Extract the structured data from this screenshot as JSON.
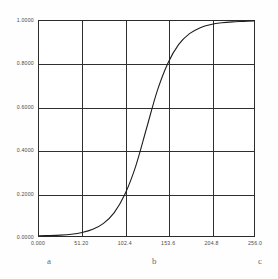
{
  "chart_data": {
    "type": "line",
    "title": "",
    "subtitle": "",
    "xlabel": "",
    "ylabel": "",
    "xlim": [
      0.0,
      256.0
    ],
    "ylim": [
      0.0,
      1.0
    ],
    "grid": true,
    "legend": null,
    "x_ticks": [
      "0.000",
      "51.20",
      "102.4",
      "153.6",
      "204.8",
      "256.0"
    ],
    "x_tick_values": [
      0.0,
      51.2,
      102.4,
      153.6,
      204.8,
      256.0
    ],
    "y_ticks": [
      "0.0000",
      "0.2000",
      "0.4000",
      "0.6000",
      "0.8000",
      "1.0000"
    ],
    "y_tick_values": [
      0.0,
      0.2,
      0.4,
      0.6,
      0.8,
      1.0
    ],
    "series": [
      {
        "name": "sigmoid",
        "color": "#1d1d1d",
        "x": [
          0.0,
          12.8,
          25.6,
          38.4,
          51.2,
          64.0,
          76.8,
          89.6,
          102.4,
          115.2,
          128.0,
          140.8,
          153.6,
          166.4,
          179.2,
          192.0,
          204.8,
          217.6,
          230.4,
          243.2,
          256.0
        ],
        "values": [
          0.001,
          0.002,
          0.004,
          0.008,
          0.016,
          0.031,
          0.059,
          0.109,
          0.195,
          0.325,
          0.5,
          0.675,
          0.805,
          0.891,
          0.941,
          0.969,
          0.984,
          0.992,
          0.996,
          0.998,
          1.0
        ]
      }
    ],
    "annotations": [
      {
        "label": "a",
        "x_value": 13.0
      },
      {
        "label": "b",
        "x_value": 137.0
      },
      {
        "label": "c",
        "x_value": 262.0
      }
    ]
  }
}
